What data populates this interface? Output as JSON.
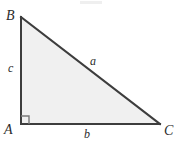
{
  "figure": {
    "type": "right-triangle-diagram",
    "caption": "",
    "canvas": {
      "width": 180,
      "height": 150,
      "background": "#ffffff"
    },
    "style": {
      "stroke_color": "#3d3d3d",
      "stroke_width": 2,
      "fill_color": "#f0f0f0",
      "label_color": "#2b2b2b",
      "right_angle_marker_color": "#7a7a7a"
    },
    "vertices": [
      {
        "name": "A",
        "label": "A",
        "x": 21,
        "y": 124,
        "angle": "right"
      },
      {
        "name": "B",
        "label": "B",
        "x": 21,
        "y": 17,
        "angle": "acute"
      },
      {
        "name": "C",
        "label": "C",
        "x": 160,
        "y": 124,
        "angle": "acute"
      }
    ],
    "sides": [
      {
        "name": "a",
        "label": "a",
        "between": "B-C",
        "role": "hypotenuse"
      },
      {
        "name": "b",
        "label": "b",
        "between": "A-C",
        "role": "leg-horizontal"
      },
      {
        "name": "c",
        "label": "c",
        "between": "A-B",
        "role": "leg-vertical"
      }
    ],
    "right_angle": {
      "at": "A",
      "marker_size": 8
    }
  }
}
